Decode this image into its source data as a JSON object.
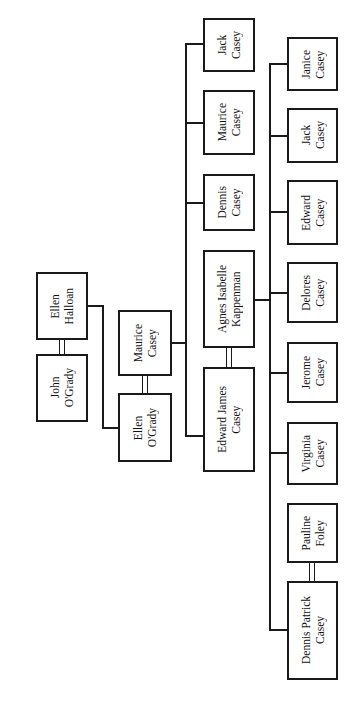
{
  "tree": {
    "generation1": {
      "ellen_halloan": "Ellen\nHalloan",
      "john_ogrady": "John\nO'Grady"
    },
    "generation2": {
      "maurice_casey": "Maurice\nCasey",
      "ellen_ogrady": "Ellen\nO'Grady"
    },
    "generation3": {
      "jack_casey": "Jack\nCasey",
      "maurice_casey": "Maurice\nCasey",
      "dennis_casey": "Dennis\nCasey",
      "agnes_kappenman": "Agnes Isabelle\nKappenman",
      "edward_james_casey": "Edward James\nCasey"
    },
    "generation4": {
      "janice_casey": "Janice\nCasey",
      "jack_casey": "Jack\nCasey",
      "edward_casey": "Edward\nCasey",
      "delores_casey": "Delores\nCasey",
      "jerome_casey": "Jerome\nCasey",
      "virginia_casey": "Virginia\nCasey",
      "pauline_foley": "Pauline\nFoley",
      "dennis_patrick_casey": "Dennis Patrick\nCasey"
    }
  }
}
